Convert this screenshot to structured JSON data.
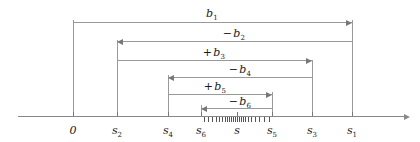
{
  "figure": {
    "background": "#ffffff",
    "line_color": "#999999",
    "text_color": "#1a1a1a",
    "width": 420,
    "height": 142
  },
  "axis": {
    "name": "number-line",
    "y": 116,
    "x_start": 18,
    "x_end": 404,
    "arrow": "right"
  },
  "axis_labels": [
    {
      "id": "origin",
      "text": "0",
      "sub": "",
      "x": 73,
      "y": 124
    },
    {
      "id": "s2",
      "text": "s",
      "sub": "2",
      "x": 117,
      "y": 124
    },
    {
      "id": "s4",
      "text": "s",
      "sub": "4",
      "x": 168,
      "y": 124
    },
    {
      "id": "s6",
      "text": "s",
      "sub": "6",
      "x": 201,
      "y": 124
    },
    {
      "id": "s",
      "text": "s",
      "sub": "",
      "x": 237,
      "y": 124
    },
    {
      "id": "s5",
      "text": "s",
      "sub": "5",
      "x": 272,
      "y": 124
    },
    {
      "id": "s3",
      "text": "s",
      "sub": "3",
      "x": 312,
      "y": 124
    },
    {
      "id": "s1",
      "text": "s",
      "sub": "1",
      "x": 352,
      "y": 124
    }
  ],
  "verticals": [
    {
      "id": "v-origin",
      "x": 73,
      "top": 20,
      "bottom": 116
    },
    {
      "id": "v-s2",
      "x": 117,
      "top": 40,
      "bottom": 116
    },
    {
      "id": "v-s4",
      "x": 168,
      "top": 75,
      "bottom": 116
    },
    {
      "id": "v-s6",
      "x": 201,
      "top": 105,
      "bottom": 116
    },
    {
      "id": "v-s5",
      "x": 272,
      "top": 92,
      "bottom": 116
    },
    {
      "id": "v-s3",
      "x": 312,
      "top": 60,
      "bottom": 116
    },
    {
      "id": "v-s1",
      "x": 352,
      "top": 20,
      "bottom": 116
    }
  ],
  "brackets": [
    {
      "id": "b1",
      "label_sign": "",
      "label_base": "b",
      "label_sub": "1",
      "y": 22,
      "x_from": 73,
      "x_to": 352,
      "direction": "right",
      "label_x": 212,
      "label_y": 7
    },
    {
      "id": "b2",
      "label_sign": "−",
      "label_base": "b",
      "label_sub": "2",
      "y": 41,
      "x_from": 352,
      "x_to": 117,
      "direction": "left",
      "label_x": 234,
      "label_y": 27
    },
    {
      "id": "b3",
      "label_sign": "+",
      "label_base": "b",
      "label_sub": "3",
      "y": 60,
      "x_from": 117,
      "x_to": 312,
      "direction": "right",
      "label_x": 214,
      "label_y": 46
    },
    {
      "id": "b4",
      "label_sign": "−",
      "label_base": "b",
      "label_sub": "4",
      "y": 77,
      "x_from": 312,
      "x_to": 168,
      "direction": "left",
      "label_x": 240,
      "label_y": 63
    },
    {
      "id": "b5",
      "label_sign": "+",
      "label_base": "b",
      "label_sub": "5",
      "y": 94,
      "x_from": 168,
      "x_to": 272,
      "direction": "right",
      "label_x": 215,
      "label_y": 80
    },
    {
      "id": "b6",
      "label_sign": "−",
      "label_base": "b",
      "label_sub": "6",
      "y": 108,
      "x_from": 272,
      "x_to": 201,
      "direction": "left",
      "label_x": 240,
      "label_y": 95
    }
  ],
  "cluster_ticks": {
    "name": "limit-point-tick-cluster",
    "y": 116,
    "height": 5,
    "positions": [
      204,
      208,
      212,
      216,
      219,
      222,
      225,
      227,
      229,
      231,
      233,
      235,
      237,
      239,
      241,
      243,
      245,
      248,
      251,
      255,
      259,
      264,
      269
    ]
  }
}
